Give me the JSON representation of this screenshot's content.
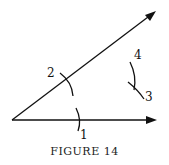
{
  "figure": {
    "caption": "FIGURE 14",
    "labels": {
      "arc1": "1",
      "arc2": "2",
      "arc3": "3",
      "arc4": "4"
    }
  }
}
